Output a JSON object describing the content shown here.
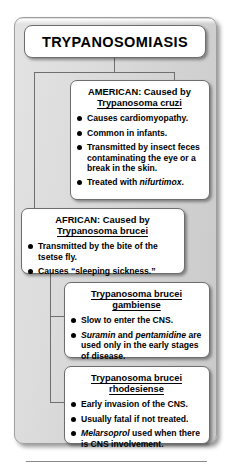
{
  "diagram": {
    "title": "TRYPANOSOMIASIS",
    "nodes": {
      "american": {
        "header_line1": "AMERICAN: Caused by",
        "header_line2": "Trypanosoma cruzi",
        "bullets": [
          "Causes cardiomyopathy.",
          "Common in infants.",
          "Transmitted by insect feces contaminating the eye or a break in the skin.",
          "Treated with nifurtimox."
        ],
        "italic_terms": [
          "nifurtimox"
        ]
      },
      "african": {
        "header_line1": "AFRICAN: Caused by",
        "header_line2": "Trypanosoma brucei",
        "bullets": [
          "Transmitted by the bite of the tsetse fly.",
          "Causes “sleeping sickness.”"
        ],
        "italic_terms": []
      },
      "gambiense": {
        "header_line1": "Trypanosoma brucei",
        "header_line2": "gambiense",
        "bullets": [
          "Slow to enter the CNS.",
          "Suramin and pentamidine are used only in the early stages of disease."
        ],
        "italic_terms": [
          "Suramin",
          "pentamidine"
        ]
      },
      "rhodesiense": {
        "header_line1": "Trypanosoma brucei",
        "header_line2": "rhodesiense",
        "bullets": [
          "Early invasion of the CNS.",
          "Usually fatal if not treated.",
          "Melarsoprol used when there is CNS involvement."
        ],
        "italic_terms": [
          "Melarsoprol"
        ]
      }
    },
    "colors": {
      "panel_background": "#dcdcdc",
      "card_background": "#ffffff",
      "border": "#6d6d6d",
      "connector": "#6f6f6f",
      "text": "#000000"
    }
  }
}
